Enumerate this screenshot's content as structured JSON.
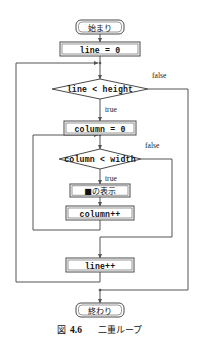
{
  "figure": {
    "caption_label": "図",
    "caption_number": "4.6",
    "caption_title": "二重ループ"
  },
  "flowchart": {
    "type": "flowchart",
    "title": "二重ループ",
    "nodes": [
      {
        "id": "start",
        "shape": "terminator",
        "text": "始まり"
      },
      {
        "id": "line_init",
        "shape": "process",
        "text": "line = 0"
      },
      {
        "id": "line_cond",
        "shape": "decision",
        "text": "line < height"
      },
      {
        "id": "column_init",
        "shape": "process",
        "text": "column = 0"
      },
      {
        "id": "column_cond",
        "shape": "decision",
        "text": "column < width"
      },
      {
        "id": "print",
        "shape": "process",
        "text": "■の表示"
      },
      {
        "id": "column_inc",
        "shape": "process",
        "text": "column++"
      },
      {
        "id": "line_inc",
        "shape": "process",
        "text": "line++"
      },
      {
        "id": "end",
        "shape": "terminator",
        "text": "終わり"
      }
    ],
    "edge_labels": {
      "outer_false": "false",
      "outer_true": "true",
      "inner_false": "false",
      "inner_true": "true"
    }
  },
  "colors": {
    "stroke": "#555555",
    "shape_stroke": "#4a4a4a",
    "text": "#111111",
    "background": "#ffffff"
  }
}
